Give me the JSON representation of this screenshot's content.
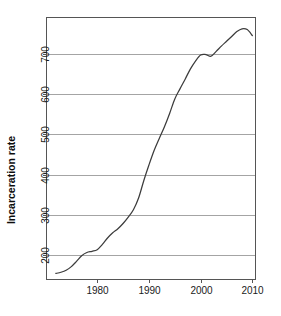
{
  "chart_data": {
    "type": "line",
    "title": "",
    "xlabel": "",
    "ylabel": "Incarceration rate",
    "xlim": [
      1970.2,
      2010.6
    ],
    "ylim": [
      140,
      790
    ],
    "grid": true,
    "grid_axis": "y",
    "legend": "none",
    "xticks": [
      1980,
      1990,
      2000,
      2010
    ],
    "xtick_labels": [
      "1980",
      "1990",
      "2000",
      "2010"
    ],
    "yticks": [
      200,
      300,
      400,
      500,
      600,
      700
    ],
    "ytick_labels": [
      "200",
      "300",
      "400",
      "500",
      "600",
      "700"
    ],
    "line_color": "#3c3c3c",
    "grid_color": "#9a9a9a",
    "frame_color": "#555555",
    "series": [
      {
        "name": "Incarceration rate",
        "x": [
          1972,
          1973,
          1974,
          1975,
          1976,
          1977,
          1978,
          1979,
          1980,
          1981,
          1982,
          1983,
          1984,
          1985,
          1986,
          1987,
          1988,
          1989,
          1990,
          1991,
          1992,
          1993,
          1994,
          1995,
          1996,
          1997,
          1998,
          1999,
          2000,
          2001,
          2002,
          2003,
          2004,
          2005,
          2006,
          2007,
          2008,
          2009,
          2010
        ],
        "values": [
          155,
          158,
          163,
          172,
          185,
          199,
          207,
          210,
          214,
          227,
          243,
          256,
          266,
          279,
          295,
          313,
          342,
          385,
          424,
          460,
          490,
          519,
          552,
          588,
          613,
          637,
          662,
          682,
          697,
          698,
          694,
          706,
          719,
          731,
          743,
          755,
          762,
          760,
          745
        ]
      }
    ],
    "annotations": []
  },
  "axis": {
    "y_title": "Incarceration rate"
  }
}
